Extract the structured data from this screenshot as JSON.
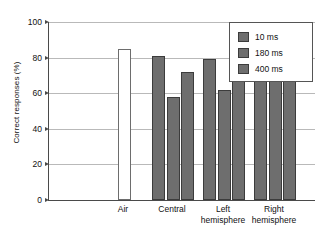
{
  "chart_data": {
    "type": "bar",
    "title": "",
    "xlabel": "",
    "ylabel": "Correct responses (%)",
    "ylim": [
      0,
      100
    ],
    "yticks": [
      0,
      20,
      40,
      60,
      80,
      100
    ],
    "grid": true,
    "legend_position": "top-right",
    "categories": [
      "Air",
      "Central",
      "Left\nhemisphere",
      "Right\nhemisphere"
    ],
    "series": [
      {
        "name": "10 ms",
        "color": "#6e6e6e",
        "values": [
          85,
          81,
          79,
          80
        ]
      },
      {
        "name": "180 ms",
        "color": "#6e6e6e",
        "values": [
          null,
          58,
          62,
          79
        ]
      },
      {
        "name": "400 ms",
        "color": "#6e6e6e",
        "values": [
          null,
          72,
          74,
          80
        ]
      }
    ],
    "air_bar_style": "hollow"
  },
  "axis": {
    "y_title": "Correct responses (%)",
    "y_tick_labels": [
      "0",
      "20",
      "40",
      "60",
      "80",
      "100"
    ]
  },
  "legend": {
    "entries": [
      {
        "label": "10 ms"
      },
      {
        "label": "180 ms"
      },
      {
        "label": "400 ms"
      }
    ]
  },
  "x_labels": [
    {
      "text": "Air"
    },
    {
      "text": "Central"
    },
    {
      "text": "Left\nhemisphere"
    },
    {
      "text": "Right\nhemisphere"
    }
  ]
}
